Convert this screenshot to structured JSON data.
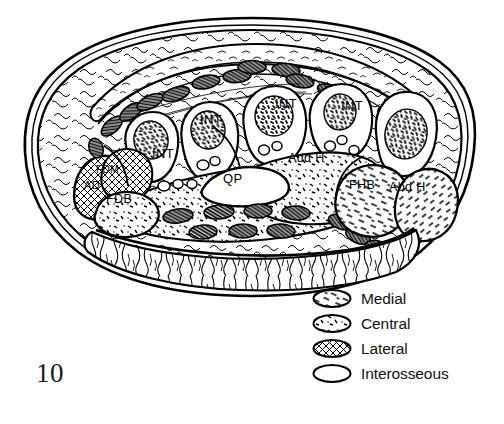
{
  "figure": {
    "number": "10",
    "type": "anatomical-cross-section"
  },
  "legend": {
    "items": [
      {
        "label": "Medial",
        "pattern": "short-dashes",
        "color": "#000000"
      },
      {
        "label": "Central",
        "pattern": "stipple-flecks",
        "color": "#000000"
      },
      {
        "label": "Lateral",
        "pattern": "crosshatch",
        "color": "#000000"
      },
      {
        "label": "Interosseous",
        "pattern": "blank",
        "color": "#000000"
      }
    ]
  },
  "diagram": {
    "labels": [
      {
        "text": "INT",
        "x": 163,
        "y": 155,
        "size": 13,
        "compartment": "interosseous"
      },
      {
        "text": "INT",
        "x": 212,
        "y": 120,
        "size": 13,
        "compartment": "interosseous"
      },
      {
        "text": "INT",
        "x": 287,
        "y": 104,
        "size": 13,
        "compartment": "interosseous"
      },
      {
        "text": "INT",
        "x": 350,
        "y": 107,
        "size": 13,
        "compartment": "interosseous"
      },
      {
        "text": "AD",
        "x": 93,
        "y": 187,
        "size": 11,
        "compartment": "lateral"
      },
      {
        "text": "FDM",
        "x": 103,
        "y": 172,
        "size": 10,
        "compartment": "lateral"
      },
      {
        "text": "FDB",
        "x": 115,
        "y": 200,
        "size": 12,
        "compartment": "central"
      },
      {
        "text": "QP",
        "x": 231,
        "y": 180,
        "size": 13,
        "compartment": "central"
      },
      {
        "text": "Add H",
        "x": 297,
        "y": 159,
        "size": 12,
        "compartment": "central"
      },
      {
        "text": "FHB",
        "x": 358,
        "y": 186,
        "size": 12,
        "compartment": "medial"
      },
      {
        "text": "Abd H",
        "x": 398,
        "y": 188,
        "size": 12,
        "compartment": "medial"
      }
    ],
    "colors": {
      "outline": "#000000",
      "fill": "#ffffff",
      "tendon": "#1a1a1a"
    }
  }
}
